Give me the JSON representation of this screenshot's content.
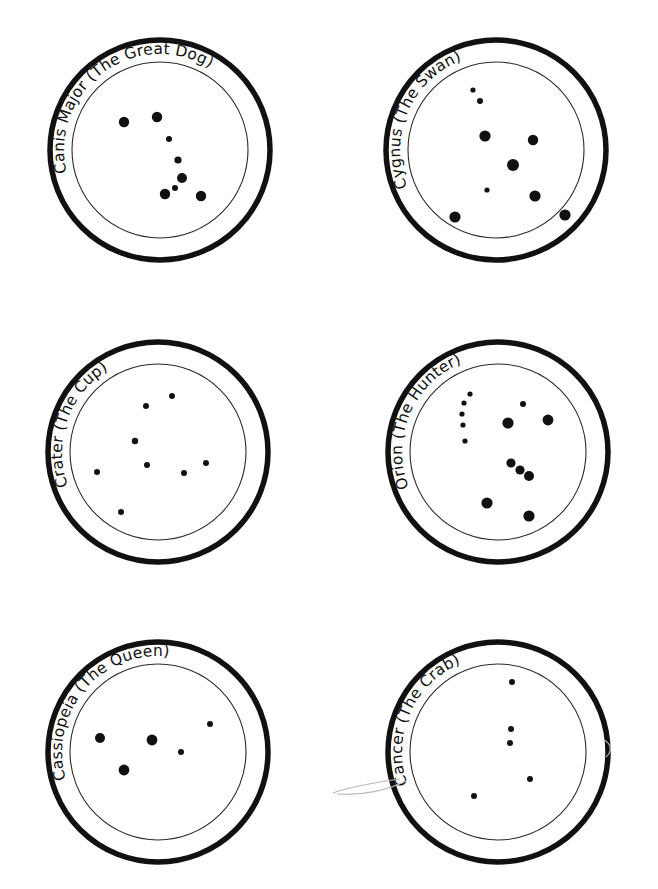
{
  "page": {
    "background_color": "#ffffff",
    "ink_color": "#111111",
    "width": 658,
    "height": 889,
    "columns": 2,
    "rows": 3
  },
  "style": {
    "outer_ring_stroke": "#111111",
    "outer_ring_width": 5.5,
    "inner_ring_stroke": "#2a2a2a",
    "inner_ring_width": 1.1,
    "star_fill": "#111111",
    "label_font_size": 15.5,
    "stray_mark_color": "#b9b9b9"
  },
  "circles": [
    {
      "id": "canis-major",
      "label": "Canis Major (The Great Dog)",
      "slot": "row1-col1",
      "center": {
        "x": 160,
        "y": 150
      },
      "outer_radius": 110,
      "inner_radius": 88,
      "label_radius": 96,
      "label_start_angle": -196,
      "star_count": 8,
      "stars": [
        {
          "x": 124,
          "y": 122,
          "r": 5.2
        },
        {
          "x": 157,
          "y": 117,
          "r": 5.2
        },
        {
          "x": 169,
          "y": 139,
          "r": 3.0
        },
        {
          "x": 178,
          "y": 160,
          "r": 3.6
        },
        {
          "x": 182,
          "y": 178,
          "r": 5.0
        },
        {
          "x": 175,
          "y": 188,
          "r": 3.0
        },
        {
          "x": 165,
          "y": 194,
          "r": 5.2
        },
        {
          "x": 201,
          "y": 196,
          "r": 5.2
        }
      ]
    },
    {
      "id": "cygnus",
      "label": "Cygnus (The Swan)",
      "slot": "row1-col2",
      "center": {
        "x": 496,
        "y": 150
      },
      "outer_radius": 110,
      "inner_radius": 88,
      "label_radius": 96,
      "label_start_angle": -205,
      "star_count": 9,
      "stars": [
        {
          "x": 473,
          "y": 90,
          "r": 2.6
        },
        {
          "x": 480,
          "y": 101,
          "r": 3.0
        },
        {
          "x": 485,
          "y": 136,
          "r": 5.6
        },
        {
          "x": 533,
          "y": 140,
          "r": 5.2
        },
        {
          "x": 513,
          "y": 165,
          "r": 6.0
        },
        {
          "x": 487,
          "y": 190,
          "r": 2.6
        },
        {
          "x": 535,
          "y": 196,
          "r": 5.6
        },
        {
          "x": 455,
          "y": 217,
          "r": 5.6
        },
        {
          "x": 565,
          "y": 215,
          "r": 5.6
        }
      ]
    },
    {
      "id": "crater",
      "label": "Crater (The Cup)",
      "slot": "row2-col1",
      "center": {
        "x": 158,
        "y": 452
      },
      "outer_radius": 110,
      "inner_radius": 88,
      "label_radius": 96,
      "label_start_angle": -203,
      "star_count": 8,
      "stars": [
        {
          "x": 172,
          "y": 396,
          "r": 3.0
        },
        {
          "x": 146,
          "y": 406,
          "r": 3.0
        },
        {
          "x": 135,
          "y": 441,
          "r": 3.2
        },
        {
          "x": 147,
          "y": 465,
          "r": 3.0
        },
        {
          "x": 97,
          "y": 472,
          "r": 3.0
        },
        {
          "x": 184,
          "y": 473,
          "r": 3.0
        },
        {
          "x": 206,
          "y": 463,
          "r": 3.0
        },
        {
          "x": 121,
          "y": 512,
          "r": 3.0
        }
      ]
    },
    {
      "id": "orion",
      "label": "Orion (The Hunter)",
      "slot": "row2-col2",
      "center": {
        "x": 498,
        "y": 452
      },
      "outer_radius": 110,
      "inner_radius": 88,
      "label_radius": 96,
      "label_start_angle": -204,
      "star_count": 13,
      "stars": [
        {
          "x": 470,
          "y": 394,
          "r": 2.6
        },
        {
          "x": 464,
          "y": 403,
          "r": 2.6
        },
        {
          "x": 462,
          "y": 414,
          "r": 2.6
        },
        {
          "x": 463,
          "y": 425,
          "r": 2.6
        },
        {
          "x": 465,
          "y": 441,
          "r": 2.6
        },
        {
          "x": 523,
          "y": 404,
          "r": 3.0
        },
        {
          "x": 508,
          "y": 423,
          "r": 5.6
        },
        {
          "x": 548,
          "y": 420,
          "r": 5.4
        },
        {
          "x": 511,
          "y": 463,
          "r": 4.6
        },
        {
          "x": 520,
          "y": 470,
          "r": 4.6
        },
        {
          "x": 529,
          "y": 476,
          "r": 5.0
        },
        {
          "x": 487,
          "y": 503,
          "r": 5.6
        },
        {
          "x": 529,
          "y": 516,
          "r": 5.6
        }
      ]
    },
    {
      "id": "cassiopeia",
      "label": "Cassiopeia (The Queen)",
      "slot": "row3-col1",
      "center": {
        "x": 158,
        "y": 752
      },
      "outer_radius": 110,
      "inner_radius": 88,
      "label_radius": 96,
      "label_start_angle": -199,
      "star_count": 5,
      "stars": [
        {
          "x": 100,
          "y": 738,
          "r": 5.0
        },
        {
          "x": 152,
          "y": 740,
          "r": 5.4
        },
        {
          "x": 181,
          "y": 752,
          "r": 3.0
        },
        {
          "x": 210,
          "y": 724,
          "r": 3.0
        },
        {
          "x": 124,
          "y": 770,
          "r": 5.4
        }
      ]
    },
    {
      "id": "cancer",
      "label": "Cancer (The Crab)",
      "slot": "row3-col2",
      "center": {
        "x": 498,
        "y": 752
      },
      "outer_radius": 110,
      "inner_radius": 88,
      "label_radius": 96,
      "label_start_angle": -202,
      "star_count": 5,
      "stars": [
        {
          "x": 512,
          "y": 682,
          "r": 3.0
        },
        {
          "x": 511,
          "y": 729,
          "r": 3.0
        },
        {
          "x": 510,
          "y": 743,
          "r": 3.0
        },
        {
          "x": 530,
          "y": 779,
          "r": 3.0
        },
        {
          "x": 474,
          "y": 796,
          "r": 3.0
        }
      ]
    }
  ],
  "stray_marks": [
    {
      "id": "pencil-smudge-left",
      "d": "M 333 793 C 352 786, 378 782, 400 779"
    },
    {
      "id": "pencil-smudge-arc",
      "d": "M 337 794 C 362 796, 388 790, 406 781"
    },
    {
      "id": "pencil-smudge-right",
      "d": "M 604 740 C 612 744, 612 752, 606 757"
    }
  ]
}
